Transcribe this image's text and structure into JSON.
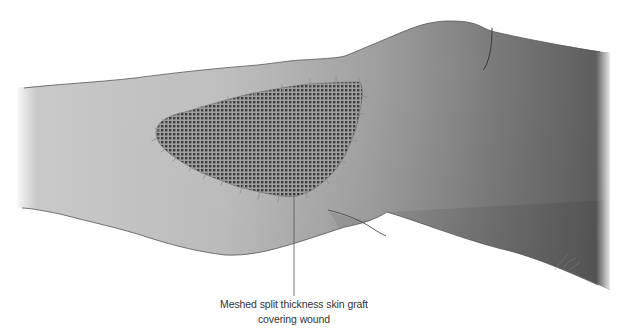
{
  "figure": {
    "colors": {
      "background": "#ffffff",
      "skin_light": "#d4d4d4",
      "skin_mid": "#a6a6a6",
      "skin_dark": "#5e5e5e",
      "outline": "#555555",
      "graft_base": "#6a6a6a",
      "graft_mesh_hole": "#3e3e3e",
      "graft_mesh_strand": "#9a9a9a",
      "suture": "#8a8a8a",
      "callout_line": "#555555",
      "label_text": "#333333"
    }
  },
  "annotations": [
    {
      "id": "graft-label",
      "line1": "Meshed split thickness skin graft",
      "line2": "covering wound",
      "points_to": "graft"
    }
  ]
}
